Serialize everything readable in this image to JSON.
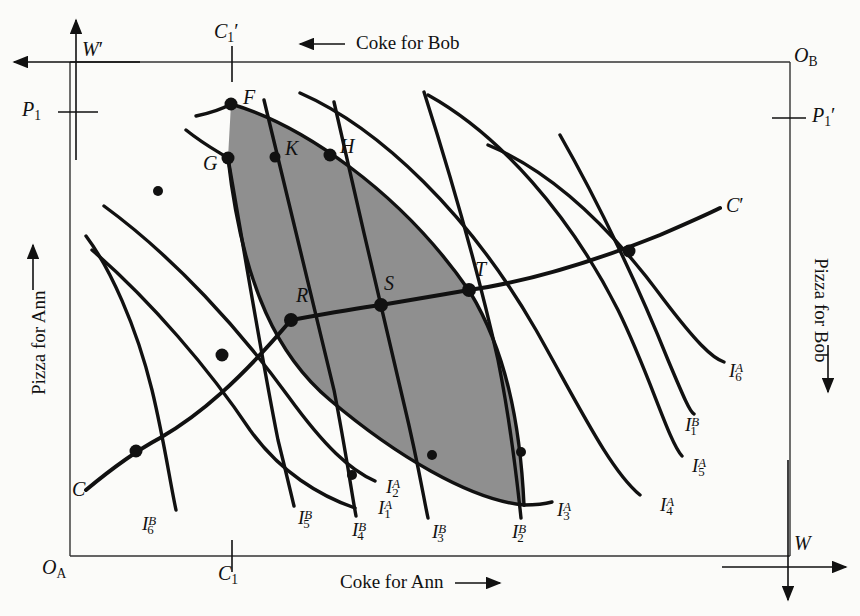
{
  "figure": {
    "type": "edgeworth-box",
    "title": "",
    "shaded_region_color": "#8f8f8f",
    "line_color": "#000000",
    "background": "#fbfbf9"
  },
  "axes": {
    "top_label": "Coke for Bob",
    "top_arrow": "←",
    "bottom_label": "Coke for Ann",
    "bottom_arrow": "→",
    "left_label": "Pizza for Ann",
    "left_arrow": "→",
    "right_label": "Pizza for Bob",
    "right_arrow": "→"
  },
  "origins": {
    "ann": {
      "base": "O",
      "sub": "A"
    },
    "bob": {
      "base": "O",
      "sub": "B"
    }
  },
  "endowment_axes": {
    "w_prime": "W",
    "w_prime_mark": "′",
    "w": "W"
  },
  "ticks": {
    "c1_prime": {
      "base": "C",
      "sub": "1",
      "mark": "′"
    },
    "c1": {
      "base": "C",
      "sub": "1",
      "mark": ""
    },
    "p1": {
      "base": "P",
      "sub": "1",
      "mark": ""
    },
    "p1_prime": {
      "base": "P",
      "sub": "1",
      "mark": "′"
    }
  },
  "contract_curve": {
    "start_label": "C",
    "end_label": "C",
    "end_mark": "′"
  },
  "points": [
    {
      "name": "F",
      "label": "F",
      "x": 231,
      "y": 104,
      "lx": 243,
      "ly": 94,
      "dot": true
    },
    {
      "name": "G",
      "label": "G",
      "x": 228,
      "y": 158,
      "lx": 206,
      "ly": 163,
      "dot": true
    },
    {
      "name": "K",
      "label": "K",
      "x": 275,
      "y": 157,
      "lx": 287,
      "ly": 146,
      "dot": true
    },
    {
      "name": "H",
      "label": "H",
      "x": 330,
      "y": 155,
      "lx": 342,
      "ly": 144,
      "dot": true
    },
    {
      "name": "R",
      "label": "R",
      "x": 291,
      "y": 320,
      "lx": 298,
      "ly": 292,
      "dot": true
    },
    {
      "name": "S",
      "label": "S",
      "x": 381,
      "y": 305,
      "lx": 386,
      "ly": 281,
      "dot": true
    },
    {
      "name": "T",
      "label": "T",
      "x": 469,
      "y": 290,
      "lx": 477,
      "ly": 266,
      "dot": true
    }
  ],
  "indifference_curves": [
    {
      "owner": "A",
      "index": "1",
      "label_base": "I",
      "lx": 378,
      "ly": 503
    },
    {
      "owner": "A",
      "index": "2",
      "label_base": "I",
      "lx": 386,
      "ly": 484
    },
    {
      "owner": "A",
      "index": "3",
      "label_base": "I",
      "lx": 557,
      "ly": 505
    },
    {
      "owner": "A",
      "index": "4",
      "label_base": "I",
      "lx": 660,
      "ly": 500
    },
    {
      "owner": "A",
      "index": "5",
      "label_base": "I",
      "lx": 692,
      "ly": 461
    },
    {
      "owner": "A",
      "index": "6",
      "label_base": "I",
      "lx": 729,
      "ly": 366
    },
    {
      "owner": "B",
      "index": "1",
      "label_base": "I",
      "lx": 685,
      "ly": 420
    },
    {
      "owner": "B",
      "index": "2",
      "label_base": "I",
      "lx": 512,
      "ly": 527
    },
    {
      "owner": "B",
      "index": "3",
      "label_base": "I",
      "lx": 432,
      "ly": 527
    },
    {
      "owner": "B",
      "index": "4",
      "label_base": "I",
      "lx": 352,
      "ly": 525
    },
    {
      "owner": "B",
      "index": "5",
      "label_base": "I",
      "lx": 298,
      "ly": 513
    },
    {
      "owner": "B",
      "index": "6",
      "label_base": "I",
      "lx": 142,
      "ly": 519
    }
  ],
  "curve_labels_overview": [
    "I_1^A",
    "I_2^A",
    "I_3^A",
    "I_4^A",
    "I_5^A",
    "I_6^A",
    "I_1^B",
    "I_2^B",
    "I_3^B",
    "I_4^B",
    "I_5^B",
    "I_6^B"
  ]
}
